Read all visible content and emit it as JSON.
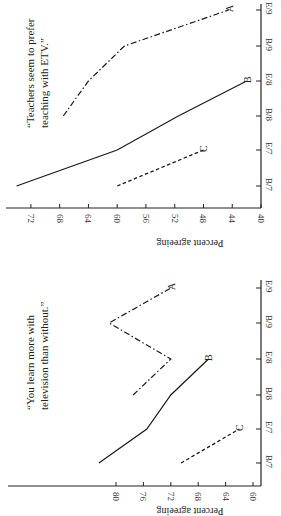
{
  "chart_data": [
    {
      "type": "line",
      "title": "“Teachers seem to prefer teaching with ETV.”",
      "annotation_lines": [
        "“Teachers seem to prefer",
        "teaching with ETV.”"
      ],
      "xlabel": "",
      "ylabel": "Percent agreeing",
      "categories": [
        "B/7",
        "E/7",
        "B/8",
        "E/8",
        "B/9",
        "E/9"
      ],
      "yticks": [
        40,
        44,
        48,
        52,
        56,
        60,
        64,
        68,
        72
      ],
      "ylim": [
        40,
        75
      ],
      "grid": false,
      "orientation": "rotated 90 degrees counterclockwise",
      "series": [
        {
          "name": "A",
          "style": "dash-dot",
          "values": [
            null,
            null,
            67.5,
            64,
            59,
            44.5
          ]
        },
        {
          "name": "B",
          "style": "solid",
          "values": [
            74,
            60,
            51.5,
            42,
            null,
            null
          ]
        },
        {
          "name": "C",
          "style": "dashed",
          "values": [
            60,
            48,
            null,
            null,
            null,
            null
          ]
        }
      ]
    },
    {
      "type": "line",
      "title": "“You learn more with television than without.”",
      "annotation_lines": [
        "“You learn more with",
        "television than without.”"
      ],
      "xlabel": "",
      "ylabel": "Percent agreeing",
      "categories": [
        "B/7",
        "E/7",
        "B/8",
        "E/8",
        "B/9",
        "E/9"
      ],
      "yticks": [
        60,
        64,
        68,
        72,
        76,
        80
      ],
      "ylim": [
        59,
        84
      ],
      "grid": false,
      "orientation": "rotated 90 degrees counterclockwise",
      "series": [
        {
          "name": "A",
          "style": "dash-dot",
          "values": [
            null,
            null,
            77.5,
            72,
            81,
            72
          ]
        },
        {
          "name": "B",
          "style": "solid",
          "values": [
            82.5,
            75.5,
            72,
            66.5,
            null,
            null
          ]
        },
        {
          "name": "C",
          "style": "dashed",
          "values": [
            70.5,
            62,
            null,
            null,
            null,
            null
          ]
        }
      ]
    }
  ]
}
